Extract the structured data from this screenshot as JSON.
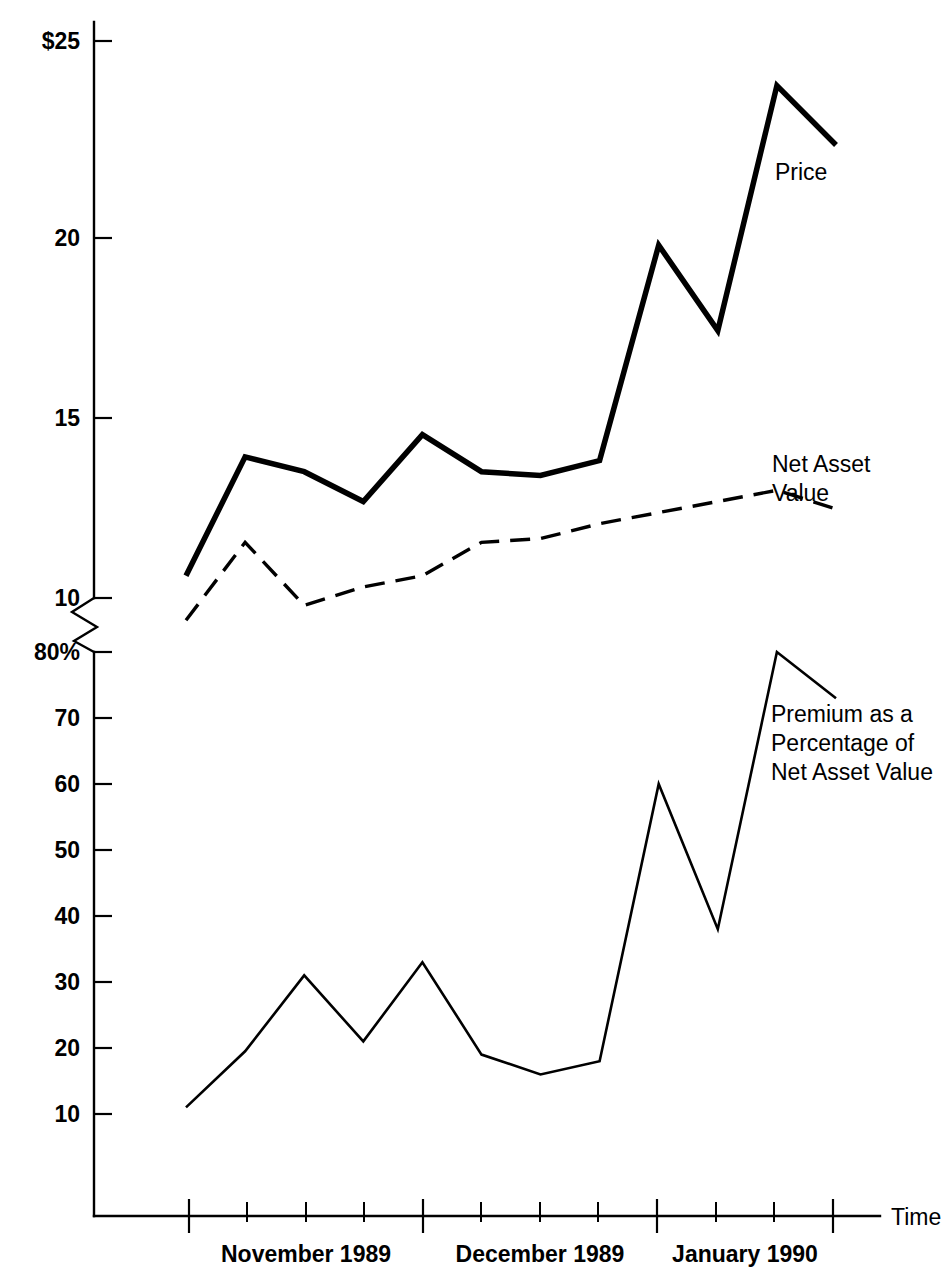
{
  "chart_data": {
    "type": "line",
    "title": "",
    "subtitle": "",
    "xlabel": "Time",
    "ylabel": "",
    "grid": false,
    "legend_position": "inline-annotations",
    "axis_note": "Single broken y-axis: upper panel is dollars ($10-$25), lower panel is percent (10%-80%)",
    "x": [
      "1989-10-27",
      "1989-11-03",
      "1989-11-10",
      "1989-11-17",
      "1989-11-24",
      "1989-12-01",
      "1989-12-08",
      "1989-12-15",
      "1989-12-22",
      "1989-12-29",
      "1990-01-05",
      "1990-01-12",
      "1990-01-19",
      "1990-01-26"
    ],
    "panels": [
      {
        "name": "price-nav-panel",
        "unit": "dollars",
        "ylim": [
          9.0,
          25.6
        ],
        "ticks": [
          {
            "value": 25,
            "label": "$25"
          },
          {
            "value": 20,
            "label": "20"
          },
          {
            "value": 15,
            "label": "15"
          },
          {
            "value": 10,
            "label": "10"
          }
        ],
        "series": [
          {
            "name": "Price",
            "style": "solid-thick",
            "label": "Price",
            "values": [
              10.6,
              13.8,
              13.4,
              12.6,
              14.4,
              13.4,
              13.3,
              13.7,
              19.5,
              17.2,
              23.8,
              22.2
            ]
          },
          {
            "name": "Net Asset Value",
            "style": "dashed",
            "label": "Net Asset Value",
            "label_lines": [
              "Net Asset",
              "Value"
            ],
            "values": [
              9.4,
              11.5,
              9.8,
              10.3,
              10.6,
              11.5,
              11.6,
              12.0,
              12.3,
              12.6,
              12.9,
              12.4
            ]
          }
        ]
      },
      {
        "name": "premium-panel",
        "unit": "percent",
        "ylim": [
          0,
          84
        ],
        "ticks": [
          {
            "value": 80,
            "label": "80%"
          },
          {
            "value": 70,
            "label": "70"
          },
          {
            "value": 60,
            "label": "60"
          },
          {
            "value": 50,
            "label": "50"
          },
          {
            "value": 40,
            "label": "40"
          },
          {
            "value": 30,
            "label": "30"
          },
          {
            "value": 20,
            "label": "20"
          },
          {
            "value": 10,
            "label": "10"
          }
        ],
        "series": [
          {
            "name": "Premium as a Percentage of Net Asset Value",
            "style": "solid-thin",
            "label": "Premium as a Percentage of Net Asset Value",
            "label_lines": [
              "Premium as a",
              "Percentage of",
              "Net Asset Value"
            ],
            "values": [
              11,
              19.5,
              31,
              21,
              33,
              19,
              16,
              18,
              60,
              38,
              80,
              73
            ]
          }
        ]
      }
    ],
    "x_periods": [
      {
        "label": "November 1989"
      },
      {
        "label": "December 1989"
      },
      {
        "label": "January 1990"
      }
    ],
    "colors": {
      "ink": "#000000",
      "background": "#ffffff"
    }
  },
  "annotations": {
    "price": "Price",
    "nav_line1": "Net Asset",
    "nav_line2": "Value",
    "premium_line1": "Premium as a",
    "premium_line2": "Percentage of",
    "premium_line3": "Net Asset Value",
    "time_axis": "Time"
  }
}
